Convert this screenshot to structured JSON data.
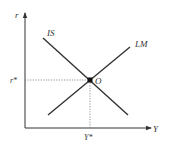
{
  "diagram": {
    "axes": {
      "y_label": "r",
      "x_label": "Y"
    },
    "curves": {
      "is_label": "IS",
      "lm_label": "LM"
    },
    "equilibrium": {
      "point_label": "O",
      "r_label": "r*",
      "y_label": "Y*"
    },
    "colors": {
      "line": "#333333",
      "dotted": "#777777",
      "background": "#ffffff"
    }
  }
}
